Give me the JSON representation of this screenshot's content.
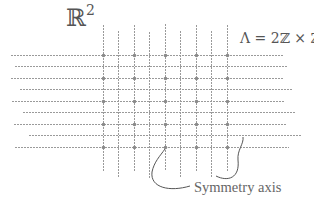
{
  "labels": {
    "space": "ℝ",
    "space_exponent": "2",
    "lattice": "Λ = 2ℤ × ℤ",
    "symmetry_axis": "Symmetry axis"
  },
  "colors": {
    "line": "#9a9a9a",
    "dot": "#8a8a8a",
    "curve": "#555555",
    "text": "#555555"
  },
  "grid": {
    "horizontal_lines": [
      {
        "y": 55,
        "x1": 11,
        "x2": 283,
        "dotted_lattice_row": true
      },
      {
        "y": 66,
        "x1": 15,
        "x2": 287,
        "dotted_lattice_row": false
      },
      {
        "y": 78,
        "x1": 11,
        "x2": 283,
        "dotted_lattice_row": true
      },
      {
        "y": 89,
        "x1": 20,
        "x2": 293,
        "dotted_lattice_row": false
      },
      {
        "y": 101,
        "x1": 12,
        "x2": 285,
        "dotted_lattice_row": true
      },
      {
        "y": 112,
        "x1": 23,
        "x2": 295,
        "dotted_lattice_row": false
      },
      {
        "y": 124,
        "x1": 14,
        "x2": 286,
        "dotted_lattice_row": true
      },
      {
        "y": 135,
        "x1": 29,
        "x2": 302,
        "dotted_lattice_row": false
      },
      {
        "y": 147,
        "x1": 15,
        "x2": 289,
        "dotted_lattice_row": true
      }
    ],
    "vertical_lines": [
      {
        "x": 103,
        "y1": 25,
        "y2": 172,
        "lattice_column": true
      },
      {
        "x": 118,
        "y1": 31,
        "y2": 177,
        "lattice_column": false
      },
      {
        "x": 134,
        "y1": 25,
        "y2": 172,
        "lattice_column": true
      },
      {
        "x": 149,
        "y1": 32,
        "y2": 178,
        "lattice_column": false
      },
      {
        "x": 165,
        "y1": 24,
        "y2": 171,
        "lattice_column": true
      },
      {
        "x": 180,
        "y1": 31,
        "y2": 177,
        "lattice_column": false
      },
      {
        "x": 196,
        "y1": 25,
        "y2": 172,
        "lattice_column": true
      },
      {
        "x": 211,
        "y1": 31,
        "y2": 177,
        "lattice_column": false
      },
      {
        "x": 227,
        "y1": 25,
        "y2": 172,
        "lattice_column": true
      }
    ],
    "lattice_point_columns": [
      103,
      134,
      165,
      196,
      227
    ],
    "lattice_point_rows": [
      55,
      78,
      101,
      124,
      147
    ]
  },
  "annotations": {
    "symmetry_axis_pointers": [
      {
        "from": [
          190,
          186
        ],
        "to": [
          165,
          148
        ],
        "path": "M 190 186 C 170 192, 150 188, 152 172 C 154 162, 160 156, 165 149"
      },
      {
        "from": [
          216,
          176
        ],
        "to": [
          243,
          136
        ],
        "path": "M 216 176 C 228 182, 240 178, 238 160 C 237 150, 244 144, 243 137"
      }
    ]
  }
}
